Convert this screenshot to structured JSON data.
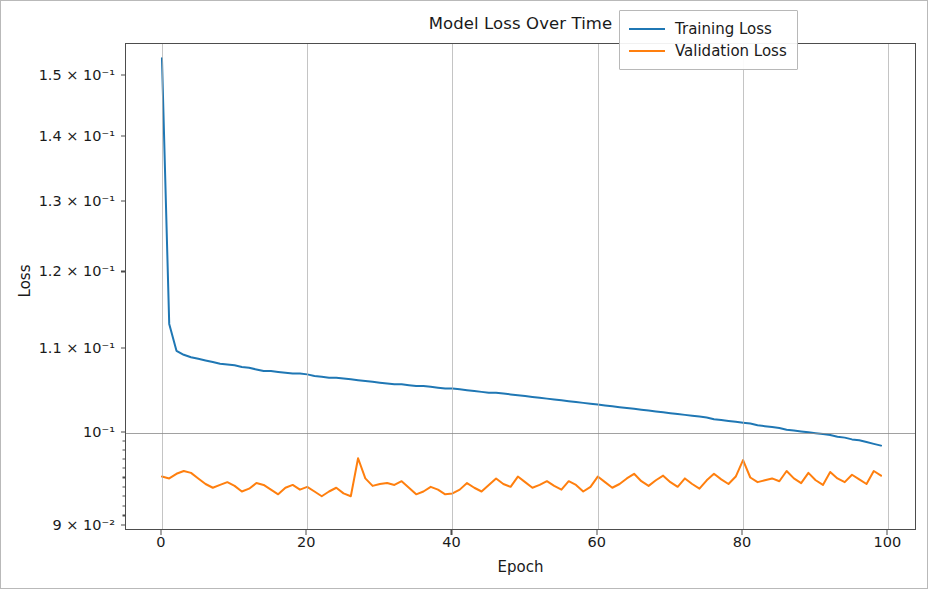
{
  "figure": {
    "width": 928,
    "height": 589,
    "background": "#ffffff",
    "frame_color": "#b9b9b9"
  },
  "chart_data": {
    "type": "line",
    "title": "Model Loss Over Time",
    "xlabel": "Epoch",
    "ylabel": "Loss",
    "yscale": "log",
    "xscale": "linear",
    "xlim": [
      -4.95,
      103.95
    ],
    "ylim": [
      0.0895,
      0.1555
    ],
    "grid": true,
    "grid_axis": "both",
    "legend_position": "upper right",
    "xticks": [
      0,
      20,
      40,
      60,
      80,
      100
    ],
    "xtick_labels": [
      "0",
      "20",
      "40",
      "60",
      "80",
      "100"
    ],
    "yticks": [
      0.09,
      0.1,
      0.11,
      0.12,
      0.13,
      0.14,
      0.15
    ],
    "ytick_labels": [
      "9 × 10⁻²",
      "10⁻¹",
      "1.1 × 10⁻¹",
      "1.2 × 10⁻¹",
      "1.3 × 10⁻¹",
      "1.4 × 10⁻¹",
      "1.5 × 10⁻¹"
    ],
    "x": [
      0,
      1,
      2,
      3,
      4,
      5,
      6,
      7,
      8,
      9,
      10,
      11,
      12,
      13,
      14,
      15,
      16,
      17,
      18,
      19,
      20,
      21,
      22,
      23,
      24,
      25,
      26,
      27,
      28,
      29,
      30,
      31,
      32,
      33,
      34,
      35,
      36,
      37,
      38,
      39,
      40,
      41,
      42,
      43,
      44,
      45,
      46,
      47,
      48,
      49,
      50,
      51,
      52,
      53,
      54,
      55,
      56,
      57,
      58,
      59,
      60,
      61,
      62,
      63,
      64,
      65,
      66,
      67,
      68,
      69,
      70,
      71,
      72,
      73,
      74,
      75,
      76,
      77,
      78,
      79,
      80,
      81,
      82,
      83,
      84,
      85,
      86,
      87,
      88,
      89,
      90,
      91,
      92,
      93,
      94,
      95,
      96,
      97,
      98,
      99
    ],
    "series": [
      {
        "name": "Training Loss",
        "color": "#1f77b4",
        "linewidth": 2.0,
        "values": [
          0.153,
          0.1132,
          0.1098,
          0.1093,
          0.109,
          0.1088,
          0.1086,
          0.1084,
          0.1082,
          0.1081,
          0.108,
          0.1078,
          0.1077,
          0.1075,
          0.1073,
          0.1073,
          0.1072,
          0.1071,
          0.107,
          0.107,
          0.1069,
          0.1067,
          0.1066,
          0.1065,
          0.1065,
          0.1064,
          0.1063,
          0.1062,
          0.1061,
          0.106,
          0.1059,
          0.1058,
          0.1057,
          0.1057,
          0.1056,
          0.1055,
          0.1055,
          0.1054,
          0.1053,
          0.1052,
          0.1052,
          0.1051,
          0.105,
          0.1049,
          0.1048,
          0.1047,
          0.1047,
          0.1046,
          0.1045,
          0.1044,
          0.1043,
          0.1042,
          0.1041,
          0.104,
          0.1039,
          0.1038,
          0.1037,
          0.1036,
          0.1035,
          0.1034,
          0.1033,
          0.1032,
          0.1031,
          0.103,
          0.1029,
          0.1028,
          0.1027,
          0.1026,
          0.1025,
          0.1024,
          0.1023,
          0.1022,
          0.1021,
          0.102,
          0.1019,
          0.1018,
          0.1016,
          0.1015,
          0.1014,
          0.1013,
          0.1012,
          0.1011,
          0.1009,
          0.1008,
          0.1007,
          0.1006,
          0.1004,
          0.1003,
          0.1002,
          0.1001,
          0.1,
          0.0999,
          0.0998,
          0.0996,
          0.0995,
          0.0993,
          0.0992,
          0.099,
          0.0988,
          0.0986
        ]
      },
      {
        "name": "Validation Loss",
        "color": "#ff7f0e",
        "linewidth": 2.0,
        "values": [
          0.0952,
          0.095,
          0.0955,
          0.0958,
          0.0956,
          0.095,
          0.0944,
          0.094,
          0.0943,
          0.0946,
          0.0942,
          0.0936,
          0.0939,
          0.0945,
          0.0943,
          0.0938,
          0.0933,
          0.094,
          0.0943,
          0.0938,
          0.0941,
          0.0936,
          0.0931,
          0.0936,
          0.094,
          0.0934,
          0.0931,
          0.0972,
          0.095,
          0.0942,
          0.0944,
          0.0945,
          0.0943,
          0.0947,
          0.094,
          0.0933,
          0.0936,
          0.0941,
          0.0938,
          0.0933,
          0.0934,
          0.0938,
          0.0945,
          0.094,
          0.0936,
          0.0943,
          0.095,
          0.0944,
          0.0941,
          0.0952,
          0.0946,
          0.094,
          0.0943,
          0.0947,
          0.0942,
          0.0938,
          0.0947,
          0.0943,
          0.0936,
          0.0941,
          0.0952,
          0.0946,
          0.094,
          0.0944,
          0.095,
          0.0955,
          0.0947,
          0.0942,
          0.0948,
          0.0953,
          0.0946,
          0.0941,
          0.095,
          0.0944,
          0.0939,
          0.0948,
          0.0955,
          0.0949,
          0.0944,
          0.0952,
          0.097,
          0.0951,
          0.0946,
          0.0948,
          0.095,
          0.0947,
          0.0958,
          0.095,
          0.0945,
          0.0956,
          0.0948,
          0.0943,
          0.0957,
          0.095,
          0.0946,
          0.0954,
          0.0949,
          0.0944,
          0.0958,
          0.0953
        ]
      }
    ]
  },
  "legend": {
    "entries": [
      {
        "label": "Training Loss",
        "color": "#1f77b4"
      },
      {
        "label": "Validation Loss",
        "color": "#ff7f0e"
      }
    ]
  }
}
